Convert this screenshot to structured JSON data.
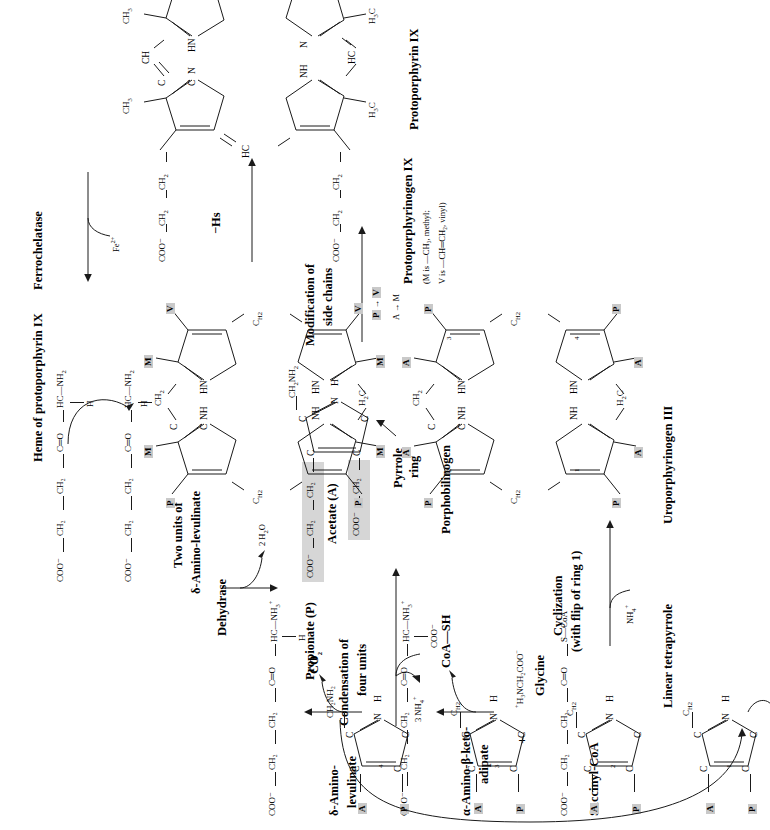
{
  "figure": {
    "orientation_deg": -90,
    "bg": "#ffffff",
    "shade_color": "#d6d6d6"
  },
  "stage1": {
    "succinyl_coa": {
      "label": "Succinyl-CoA",
      "atoms": [
        "COO⁻",
        "CH₂",
        "CH₂",
        "C═O",
        "S—CoA"
      ]
    },
    "plus": "+",
    "glycine": {
      "label": "Glycine",
      "formula_main": "H₃NCH₂COO",
      "formula_pluscharge": "+",
      "formula_minuscharge": "−"
    },
    "byproduct": "CoA—SH"
  },
  "stage2": {
    "label_line1": "α-Amino-β-keto-",
    "label_line2": "adipate",
    "atoms": [
      "COO⁻",
      "CH₂",
      "CH₂",
      "C═O",
      "HC—NH₃⁺",
      "COO⁻"
    ],
    "byproduct": "CO₂"
  },
  "stage3": {
    "label_line1": "δ-Amino-",
    "label_line2": "levulinate",
    "atoms": [
      "COO⁻",
      "CH₂",
      "CH₂",
      "C═O",
      "HC—NH₃⁺",
      "H"
    ]
  },
  "stage4": {
    "title_line1": "Two units of",
    "title_line2": "δ-Amino-levulinate",
    "enzyme": "Dehydrase",
    "byproduct": "2 H₂O",
    "unitA": [
      "COO⁻",
      "CH₂",
      "CH₂",
      "C═O",
      "HC—NH₂",
      "H"
    ],
    "unitB": [
      "COO⁻",
      "CH₂",
      "CH₂",
      "C═O",
      "HC—NH₂",
      "H"
    ]
  },
  "porphobilinogen": {
    "label": "Porphobilinogen",
    "acetate_label": "Acetate (A)",
    "propionate_label": "Propionate (P)",
    "pyrrole_note_line1": "Pyrrole",
    "pyrrole_note_line2": "ring",
    "propionate_chain": [
      "COO⁻",
      "CH₂",
      "CH₂"
    ],
    "acetate_chain": [
      "COO⁻",
      "CH₂"
    ],
    "side_chain": "CH₂NH₂",
    "ring_atoms": [
      "C",
      "C",
      "C",
      "C",
      "N",
      "H"
    ]
  },
  "condensation": {
    "line1": "Condensation of",
    "line2": "four units",
    "byproduct": "3 NH₄⁺"
  },
  "linear_tetrapyrrole": {
    "label": "Linear tetrapyrrole",
    "ring_numbers": [
      "1",
      "2",
      "3",
      "4"
    ],
    "substituent_P": "P",
    "substituent_A": "A",
    "terminal": "CH₂NH₂",
    "bridge": "C",
    "bridge_sub": "H₂",
    "nh": "N",
    "h": "H"
  },
  "cyclization": {
    "line1": "Cyclization",
    "line2": "(with flip of ring 1)",
    "byproduct": "NH₄⁺"
  },
  "uroporphyrinogen": {
    "label": "Uroporphyrinogen III",
    "ring_numbers": [
      "1",
      "2",
      "3",
      "4"
    ],
    "substituents": [
      "A",
      "P",
      "A",
      "P",
      "A",
      "P",
      "A",
      "P"
    ],
    "bridges": [
      "CH₂",
      "H₂C",
      "C",
      "C"
    ],
    "nitrogens": [
      "NH",
      "NH",
      "HN",
      "HN"
    ]
  },
  "modification": {
    "line1": "Modification of",
    "line2": "side chains",
    "rule1_from": "P",
    "rule1_arrow": "→",
    "rule1_to": "V",
    "rule2_from": "A",
    "rule2_arrow": "→",
    "rule2_to": "M"
  },
  "protoporphyrinogen": {
    "label": "Protoporphyrinogen IX",
    "note_line1": "(M is —CH₃, methyl;",
    "note_line2": "V is —CH═CH₂, vinyl)",
    "substituents": [
      "M",
      "P",
      "M",
      "P",
      "M",
      "V",
      "M",
      "V"
    ],
    "bridges": [
      "CH₂",
      "H₂C"
    ],
    "nitrogens": [
      "NH",
      "NH",
      "HN",
      "HN"
    ]
  },
  "oxidation": {
    "label": "−Hs"
  },
  "protoporphyrin": {
    "label": "Protoporphyrin IX",
    "side_chains_left": [
      "COO⁻",
      "CH₂",
      "CH₂"
    ],
    "methyls": [
      "CH₃",
      "CH₃",
      "H₃C",
      "H₃C"
    ],
    "vinyls": [
      "CH═CH₂",
      "H₂C═CH"
    ],
    "bridges": [
      "CH",
      "HC",
      "HC",
      "CH"
    ],
    "nitrogens": [
      "N",
      "N",
      "NH",
      "HN"
    ]
  },
  "ferrochelatase": {
    "enzyme": "Ferrochelatase",
    "substrate": "Fe²⁺",
    "product_label": "Heme of protoporphyrin IX"
  }
}
